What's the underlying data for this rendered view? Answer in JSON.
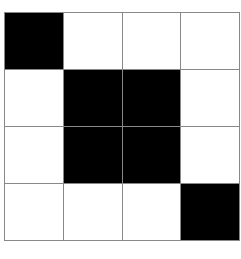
{
  "grid": {
    "rows": 4,
    "cols": 4,
    "colors": {
      "filled": "#000000",
      "empty": "#ffffff",
      "line": "#888888"
    },
    "cells": [
      [
        1,
        0,
        0,
        0
      ],
      [
        0,
        1,
        1,
        0
      ],
      [
        0,
        1,
        1,
        0
      ],
      [
        0,
        0,
        0,
        1
      ]
    ]
  }
}
